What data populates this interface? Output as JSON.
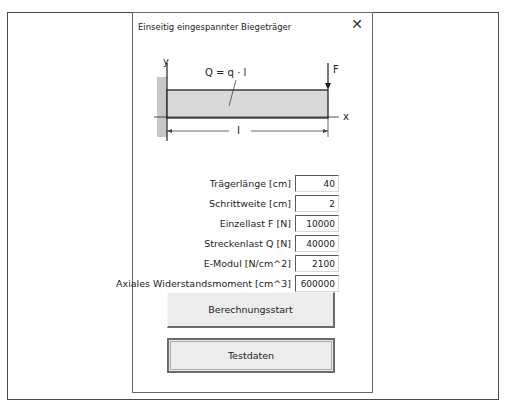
{
  "dialog": {
    "title": "Einseitig eingespannter Biegeträger",
    "close_icon": "close-icon"
  },
  "diagram": {
    "y_axis_label": "y",
    "x_axis_label": "x",
    "load_label": "Q = q · l",
    "force_label": "F",
    "length_label": "l",
    "colors": {
      "beam_fill": "#d9d9d9",
      "wall_fill": "#c8c8c8",
      "line": "#222222"
    }
  },
  "fields": [
    {
      "label": "Trägerlänge [cm]",
      "value": "40"
    },
    {
      "label": "Schrittweite [cm]",
      "value": "2"
    },
    {
      "label": "Einzellast F [N]",
      "value": "10000"
    },
    {
      "label": "Streckenlast Q [N]",
      "value": "40000"
    },
    {
      "label": "E-Modul [N/cm^2]",
      "value": "2100"
    },
    {
      "label": "Axiales Widerstandsmoment [cm^3]",
      "value": "600000"
    }
  ],
  "buttons": {
    "start_label": "Berechnungsstart",
    "testdata_label": "Testdaten"
  }
}
